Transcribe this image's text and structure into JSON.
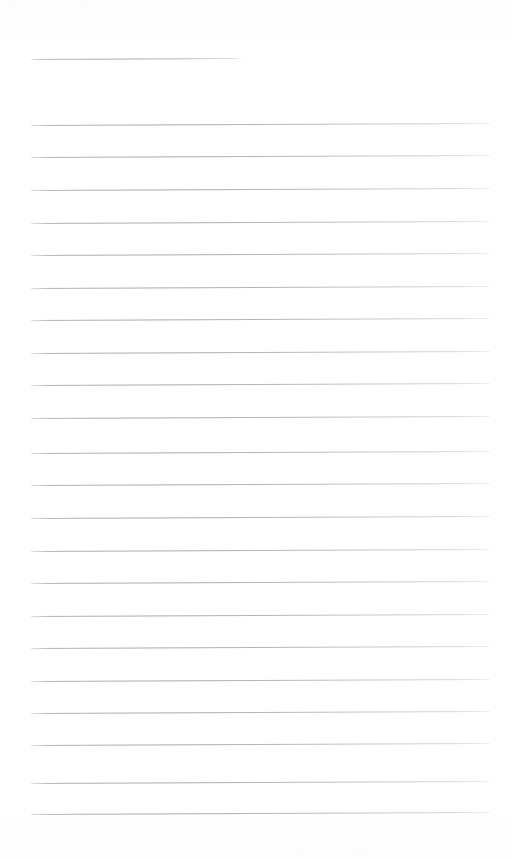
{
  "document": {
    "kind": "scanned-lined-notebook-page",
    "caption": "Blank ruled notebook page",
    "page_width": 512,
    "page_height": 859,
    "background_color": "#fefefe",
    "rule_color": "#a8a8b1",
    "has_text": false,
    "text_content": ""
  },
  "layout": {
    "left_margin_x": 31,
    "right_margin_x": 490,
    "body_line_spacing": 32.4,
    "slant_degrees": -0.25
  },
  "title_rule": {
    "label": "title rule",
    "y": 59,
    "x_start": 31,
    "x_end": 243,
    "width": 212
  },
  "body_rules": {
    "label": "ruled writing lines",
    "count": 22,
    "x_start": 31,
    "x_end": 490,
    "width": 459,
    "y_positions": [
      125,
      157,
      190,
      223,
      255,
      288,
      320,
      353,
      385,
      418,
      453,
      485,
      518,
      551,
      583,
      616,
      648,
      681,
      713,
      745,
      783,
      814
    ]
  },
  "artifacts": {
    "top_speckle_label": "scanner speckle band (top edge)",
    "bottom_speckle_label": "scanner speckle band (bottom edge)"
  }
}
